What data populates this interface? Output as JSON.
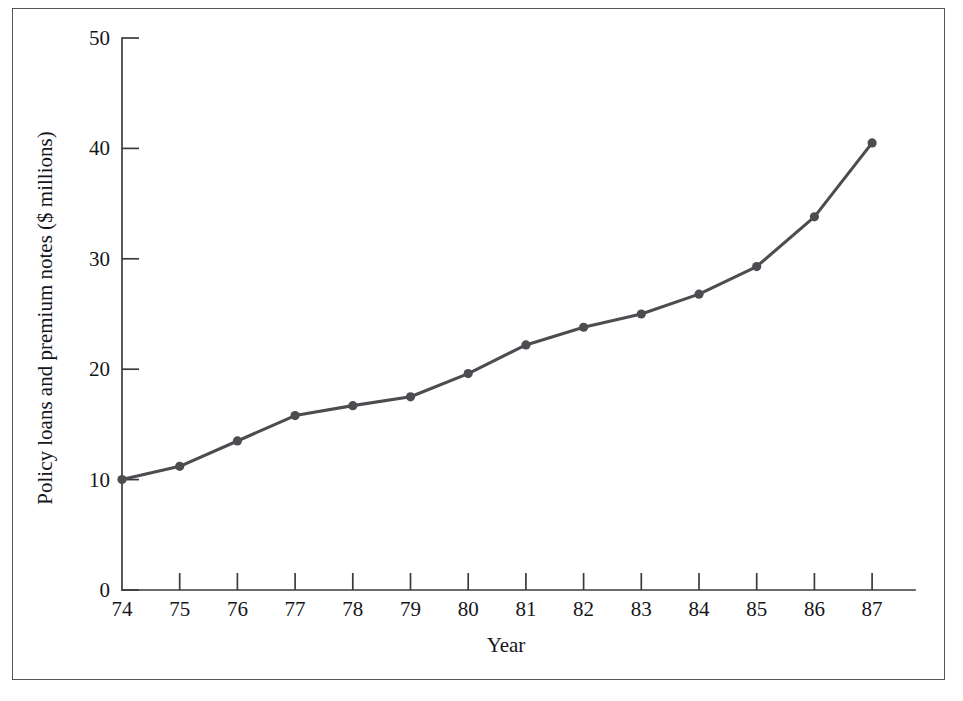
{
  "figure": {
    "frame_color": "#55565a",
    "background": "#ffffff"
  },
  "chart_data": {
    "type": "line",
    "title": "",
    "subtitle": "",
    "xlabel": "Year",
    "ylabel": "Policy loans and premium notes ($ millions)",
    "x": [
      74,
      75,
      76,
      77,
      78,
      79,
      80,
      81,
      82,
      83,
      84,
      85,
      86,
      87
    ],
    "categories": [
      "74",
      "75",
      "76",
      "77",
      "78",
      "79",
      "80",
      "81",
      "82",
      "83",
      "84",
      "85",
      "86",
      "87"
    ],
    "values": [
      10.0,
      11.2,
      13.5,
      15.8,
      16.7,
      17.5,
      19.6,
      22.2,
      23.8,
      25.0,
      26.8,
      29.3,
      33.8,
      40.5
    ],
    "series": [
      {
        "name": "Policy loans and premium notes",
        "values": [
          10.0,
          11.2,
          13.5,
          15.8,
          16.7,
          17.5,
          19.6,
          22.2,
          23.8,
          25.0,
          26.8,
          29.3,
          33.8,
          40.5
        ],
        "color": "#4c4d51",
        "marker": "circle"
      }
    ],
    "xlim": [
      74,
      87
    ],
    "ylim": [
      0,
      50
    ],
    "ytick_labels": [
      "0",
      "10",
      "20",
      "30",
      "40",
      "50"
    ],
    "ytick_values": [
      0,
      10,
      20,
      30,
      40,
      50
    ],
    "xtick_labels": [
      "74",
      "75",
      "76",
      "77",
      "78",
      "79",
      "80",
      "81",
      "82",
      "83",
      "84",
      "85",
      "86",
      "87"
    ],
    "grid": false,
    "legend": false,
    "legend_position": "none",
    "line_color": "#4c4d51",
    "marker_color": "#4c4d51",
    "axis_color": "#3a3b3f"
  }
}
